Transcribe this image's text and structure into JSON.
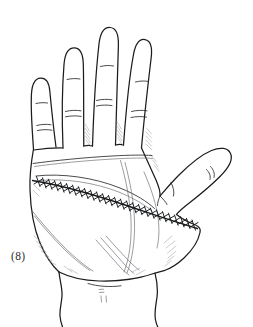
{
  "figure": {
    "label": "(8)",
    "title": "Palmar view of right hand with transverse sutured incision",
    "view": "palmar",
    "technique": "pen-and-ink line drawing with hatched shading",
    "background_color": "#ffffff",
    "outline_color": "#1c1c1c",
    "crease_color": "#2a2a2a",
    "shading_color": "#9aa0a6",
    "suture_color": "#17181a"
  },
  "anatomy": {
    "digits": [
      {
        "name": "index-finger",
        "position": "second-from-left",
        "crease_count": 3
      },
      {
        "name": "middle-finger",
        "position": "third-from-left",
        "crease_count": 3
      },
      {
        "name": "ring-finger",
        "position": "fourth-from-left",
        "crease_count": 3
      },
      {
        "name": "little-finger",
        "position": "leftmost",
        "crease_count": 3
      },
      {
        "name": "thumb",
        "position": "right-side-abducted",
        "crease_count": 2
      }
    ],
    "regions": [
      {
        "name": "palm",
        "label": "palm"
      },
      {
        "name": "thenar-eminence",
        "label": "thenar eminence"
      },
      {
        "name": "hypothenar-eminence",
        "label": "hypothenar eminence"
      },
      {
        "name": "wrist",
        "label": "wrist"
      }
    ],
    "creases": [
      {
        "name": "distal-palmar-crease"
      },
      {
        "name": "proximal-palmar-crease"
      },
      {
        "name": "thenar-crease"
      },
      {
        "name": "wrist-crease"
      }
    ]
  },
  "incision": {
    "name": "transverse-palmar-incision",
    "orientation": "transverse, sloping down to the right",
    "closure": "interrupted sutures",
    "stitch_count": 28,
    "start_point": {
      "x": 33,
      "y": 180
    },
    "end_point": {
      "x": 198,
      "y": 228
    }
  }
}
